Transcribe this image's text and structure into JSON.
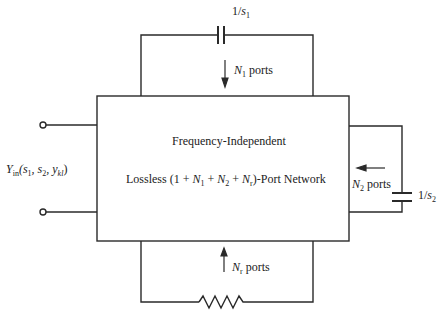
{
  "diagram": {
    "network_box": {
      "line1": "Frequency-Independent",
      "line2_prefix": "Lossless (1 + ",
      "line2_N1": "N",
      "line2_N1_sub": "1",
      "line2_plus1": " + ",
      "line2_N2": "N",
      "line2_N2_sub": "2",
      "line2_plus2": " + ",
      "line2_Nr": "N",
      "line2_Nr_sub": "r",
      "line2_suffix": ")-Port  Network"
    },
    "top_capacitor": {
      "label_num": "1/",
      "label_var": "s",
      "label_sub": "1"
    },
    "top_ports": {
      "var": "N",
      "sub": "1",
      "text": " ports"
    },
    "right_capacitor": {
      "label_num": "1/",
      "label_var": "s",
      "label_sub": "2"
    },
    "right_ports": {
      "var": "N",
      "sub": "2",
      "text": " ports"
    },
    "bottom_ports": {
      "var": "N",
      "sub": "r",
      "text": " ports"
    },
    "input_admittance": {
      "var": "Y",
      "sub": "in",
      "args": "(s",
      "a1": "1",
      "mid": ", s",
      "a2": "2",
      "mid2": ", y",
      "a3": "kl",
      "close": ")"
    },
    "colors": {
      "line": "#2a2a2a",
      "background": "#ffffff"
    }
  }
}
